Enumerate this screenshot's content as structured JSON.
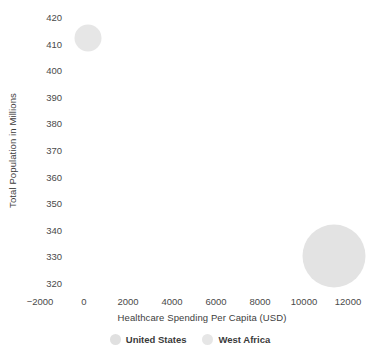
{
  "chart_data": {
    "type": "scatter",
    "title": "",
    "xlabel": "Healthcare Spending Per Capita (USD)",
    "ylabel": "Total Population in Millions",
    "xlim": [
      -3000,
      13000
    ],
    "ylim": [
      316,
      424
    ],
    "xticks": [
      -2000,
      0,
      2000,
      4000,
      6000,
      8000,
      10000,
      12000
    ],
    "yticks": [
      320,
      330,
      340,
      350,
      360,
      370,
      380,
      390,
      400,
      410,
      420
    ],
    "xtick_labels": [
      "−2000",
      "0",
      "2000",
      "4000",
      "6000",
      "8000",
      "10000",
      "12000"
    ],
    "ytick_labels": [
      "320",
      "330",
      "340",
      "350",
      "360",
      "370",
      "380",
      "390",
      "400",
      "410",
      "420"
    ],
    "grid": false,
    "legend_position": "bottom",
    "series": [
      {
        "name": "United States",
        "color": "#e6e6e6",
        "x": 200,
        "y": 412,
        "size_radius_px": 13.5
      },
      {
        "name": "West Africa",
        "color": "#e3e3e3",
        "x": 11350,
        "y": 330,
        "size_radius_px": 31.5
      }
    ]
  },
  "legend": {
    "items": [
      {
        "label": "United States",
        "color": "#e0e0e0"
      },
      {
        "label": "West Africa",
        "color": "#e6e6e6"
      }
    ]
  },
  "axes": {
    "y_title": "Total Population in Millions",
    "x_title": "Healthcare Spending Per Capita (USD)"
  }
}
